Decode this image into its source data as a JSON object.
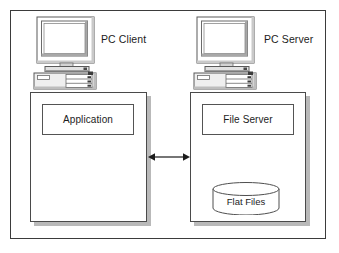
{
  "diagram": {
    "frame": {
      "name": "outer-frame"
    },
    "nodes": [
      {
        "id": "client",
        "caption": "PC Client",
        "device_icon": "desktop-computer-icon",
        "component_label": "Application"
      },
      {
        "id": "server",
        "caption": "PC Server",
        "device_icon": "desktop-computer-icon",
        "component_label": "File Server",
        "datastore_label": "Flat Files",
        "datastore_icon": "database-cylinder-icon"
      }
    ],
    "connector": {
      "icon": "double-headed-arrow-icon",
      "label": "",
      "from": "client",
      "to": "server"
    },
    "colors": {
      "background": "#ffffff",
      "frame_stroke": "#3b3b3b",
      "box_stroke": "#4a4a4a",
      "inner_stroke": "#545454",
      "shadow": "#b9b9b9",
      "text": "#1c1c1c",
      "device_fill": "#e6e6e6",
      "screen_fill": "#ffffff"
    }
  }
}
